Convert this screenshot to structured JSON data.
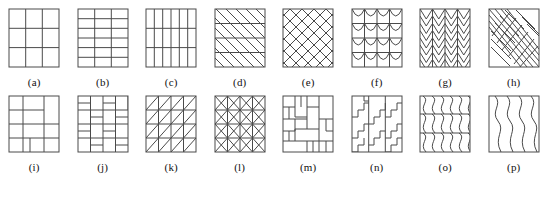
{
  "figure": {
    "name": "texture-tiling-pattern-chart",
    "background_color": "#ffffff",
    "stroke_color": "#3b3b3b",
    "border_color": "#555555"
  },
  "rows": [
    {
      "name": "top-row",
      "tiles": [
        {
          "label": "(a)",
          "key": "a",
          "pattern": "grid-3x3",
          "description": "regular square grid, 3 columns by 3 rows"
        },
        {
          "label": "(b)",
          "key": "b",
          "pattern": "grid-3col-6row",
          "description": "grid with 3 columns and 6 narrow horizontal rows"
        },
        {
          "label": "(c)",
          "key": "c",
          "pattern": "grid-6col-3row",
          "description": "grid with 6 narrow vertical columns and 3 rows"
        },
        {
          "label": "(d)",
          "key": "d",
          "pattern": "diagonal-hatch-horizontal-bands",
          "description": "parallel diagonal lines crossed by horizontal band lines"
        },
        {
          "label": "(e)",
          "key": "e",
          "pattern": "diamond-lattice",
          "description": "cross-hatched diagonal lattice forming diamonds"
        },
        {
          "label": "(f)",
          "key": "f",
          "pattern": "scalloped-arcs",
          "description": "rows of drooping scalloped arcs between vertical lines"
        },
        {
          "label": "(g)",
          "key": "g",
          "pattern": "chevron-zigzag",
          "description": "stacked chevron V shapes between vertical lines"
        },
        {
          "label": "(h)",
          "key": "h",
          "pattern": "herringbone-feather",
          "description": "feather herringbone with diagonal spine and angled barbs"
        }
      ]
    },
    {
      "name": "bottom-row",
      "tiles": [
        {
          "label": "(i)",
          "key": "i",
          "pattern": "pinwheel-interlock",
          "description": "large interlocking pinwheel rectangles"
        },
        {
          "label": "(j)",
          "key": "j",
          "pattern": "basket-weave-parquet",
          "description": "basket weave parquet of alternating brick pairs"
        },
        {
          "label": "(k)",
          "key": "k",
          "pattern": "grid-single-diagonal-triangles",
          "description": "square grid with one diagonal per cell forming triangles"
        },
        {
          "label": "(l)",
          "key": "l",
          "pattern": "grid-double-diagonal-x",
          "description": "square grid with both diagonals per cell forming X shapes"
        },
        {
          "label": "(m)",
          "key": "m",
          "pattern": "interlocking-l-blocks",
          "description": "irregular interlocking L-shaped tetromino blocks"
        },
        {
          "label": "(n)",
          "key": "n",
          "pattern": "staircase-step-lines",
          "description": "vertical lines with stepped staircase zigzag lines"
        },
        {
          "label": "(o)",
          "key": "o",
          "pattern": "s-curve-waves-banded",
          "description": "repeating S-curve wavy vertical lines split into horizontal bands"
        },
        {
          "label": "(p)",
          "key": "p",
          "pattern": "vertical-zigzag-waves",
          "description": "tall vertical zigzag wave lines"
        }
      ]
    }
  ]
}
